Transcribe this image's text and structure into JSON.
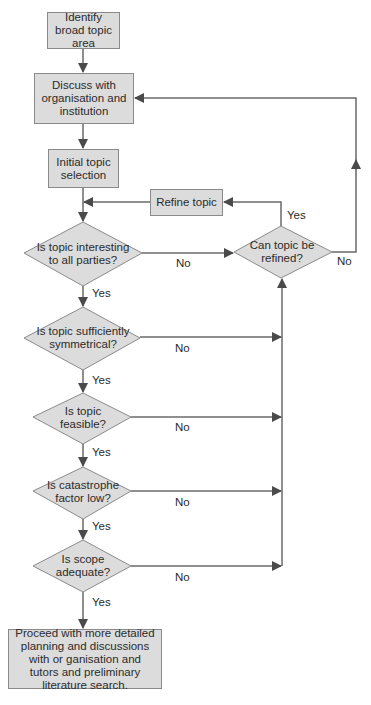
{
  "flowchart": {
    "nodes": {
      "identify": "Identify broad topic area",
      "discuss": "Discuss with organisation and institution",
      "initial": "Initial topic selection",
      "refine": "Refine topic",
      "q_interesting": "Is topic interesting to all parties?",
      "q_can_refine": "Can topic be refined?",
      "q_symmetrical": "Is topic sufficiently symmetrical?",
      "q_feasible": "Is topic feasible?",
      "q_catastrophe": "Is catastrophe factor low?",
      "q_scope": "Is scope adequate?",
      "proceed": "Proceed with more detailed planning and discussions with or ganisation and tutors and preliminary literature search."
    },
    "labels": {
      "yes": "Yes",
      "no": "No"
    },
    "colors": {
      "fill": "#dcdcdc",
      "border": "#8a8a8a",
      "line": "#6a6a6a",
      "arrow": "#4a4a4a"
    }
  }
}
